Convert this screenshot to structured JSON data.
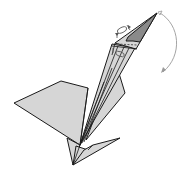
{
  "diagram": {
    "colors": {
      "paper": "#d6d6d6",
      "paper_shaded": "#8a8a8a",
      "outline": "#1a1a1a",
      "arrow": "#9a9a9a"
    },
    "annotations": [
      {
        "name": "fold-direction-arrow",
        "type": "curved arrow",
        "description": "curved arrow from beak tip swinging down to the right"
      },
      {
        "name": "reverse-fold-symbol-top",
        "type": "sink/crimp symbol",
        "description": "bracketed oval symbol above head"
      },
      {
        "name": "reverse-fold-symbol-neck",
        "type": "sink/crimp symbol",
        "description": "oval symbol on neck below head"
      }
    ]
  }
}
